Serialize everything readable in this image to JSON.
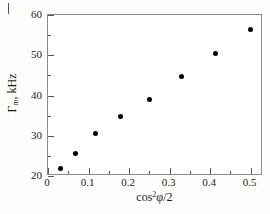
{
  "figure": {
    "label_stub": "I",
    "background_color": "#fdfdfc",
    "frame_color": "#8a8a8a",
    "marker_color": "#000000"
  },
  "chart_data": {
    "type": "scatter",
    "title": "",
    "xlabel_plain": "cos^2 phi/2",
    "xlabel_parts": {
      "base": "cos",
      "exponent": "2",
      "symbol": "φ",
      "suffix": "/2"
    },
    "ylabel_plain": "Γm, kHz",
    "ylabel_parts": {
      "symbol": "Γ",
      "subscript": "m",
      "suffix": ", kHz"
    },
    "xlim": [
      0,
      0.5308
    ],
    "ylim": [
      20,
      60
    ],
    "grid": false,
    "legend": null,
    "xticks": [
      0,
      0.1,
      0.2,
      0.3,
      0.4,
      0.5
    ],
    "xtick_labels": [
      "0",
      "0.1",
      "0.2",
      "0.3",
      "0.4",
      "0.5"
    ],
    "xticks_minor": [
      0.05,
      0.15,
      0.25,
      0.35,
      0.45
    ],
    "yticks": [
      20,
      30,
      40,
      50,
      60
    ],
    "ytick_labels": [
      "20",
      "30",
      "40",
      "50",
      "60"
    ],
    "yticks_minor": [
      25,
      35,
      45,
      55
    ],
    "series": [
      {
        "name": "Gamma_m",
        "marker": "filled-circle",
        "color": "#000000",
        "points": [
          {
            "x": 0.03,
            "y": 21.8
          },
          {
            "x": 0.067,
            "y": 25.6
          },
          {
            "x": 0.117,
            "y": 30.5
          },
          {
            "x": 0.179,
            "y": 34.7
          },
          {
            "x": 0.251,
            "y": 39.0
          },
          {
            "x": 0.329,
            "y": 44.7
          },
          {
            "x": 0.414,
            "y": 50.4
          },
          {
            "x": 0.501,
            "y": 56.5
          }
        ]
      }
    ]
  }
}
